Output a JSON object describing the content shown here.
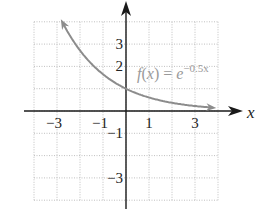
{
  "chart_data": {
    "type": "line",
    "title": "",
    "function_label": "f(x) = e^(-0.5x)",
    "label_parts": {
      "f": "f",
      "open": "(",
      "x": "x",
      "close": ")",
      "eq": " = ",
      "base": "e",
      "exponent": "−0.5x"
    },
    "xlabel": "x",
    "ylabel": "",
    "xlim": [
      -4,
      4
    ],
    "ylim": [
      -4,
      4
    ],
    "grid": true,
    "x_tick_labels": [
      {
        "value": -3,
        "text": "−3"
      },
      {
        "value": -1,
        "text": "−1"
      },
      {
        "value": 1,
        "text": "1"
      },
      {
        "value": 3,
        "text": "3"
      }
    ],
    "y_tick_labels": [
      {
        "value": 3,
        "text": "3"
      },
      {
        "value": 2,
        "text": "2"
      },
      {
        "value": -1,
        "text": "−1"
      },
      {
        "value": -3,
        "text": "−3"
      }
    ],
    "series": [
      {
        "name": "f(x) = e^(-0.5x)",
        "color": "#8c8c8c",
        "x": [
          -2.8,
          -2,
          -1,
          0,
          1,
          2,
          3,
          3.8
        ],
        "y": [
          4.06,
          2.72,
          1.65,
          1.0,
          0.61,
          0.37,
          0.22,
          0.15
        ],
        "arrows_both_ends": true
      }
    ]
  },
  "colors": {
    "axis": "#1a1a1a",
    "grid": "#b0b0b0",
    "curve": "#8c8c8c"
  }
}
